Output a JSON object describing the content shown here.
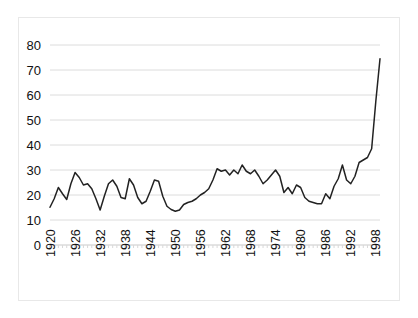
{
  "chart_data": {
    "type": "line",
    "title": "",
    "subtitle": "",
    "xlabel": "",
    "ylabel": "",
    "xlim": [
      1920,
      1999
    ],
    "ylim": [
      0,
      80
    ],
    "ytick_step": 10,
    "yticks": [
      0,
      10,
      20,
      30,
      40,
      50,
      60,
      70,
      80
    ],
    "xticks": [
      1920,
      1926,
      1932,
      1938,
      1944,
      1950,
      1956,
      1962,
      1968,
      1974,
      1980,
      1986,
      1992,
      1998
    ],
    "xtick_labels": [
      "1920",
      "1926",
      "1932",
      "1938",
      "1944",
      "1950",
      "1956",
      "1962",
      "1968",
      "1974",
      "1980",
      "1986",
      "1992",
      "1998"
    ],
    "ytick_labels": [
      "0",
      "10",
      "20",
      "30",
      "40",
      "50",
      "60",
      "70",
      "80"
    ],
    "grid": "horizontal",
    "legend": "none",
    "legend_position": "none",
    "line_color": "#222222",
    "grid_color": "#dcdcdc",
    "background_color": "#ffffff",
    "series": [
      {
        "name": "value",
        "x": [
          1920,
          1921,
          1922,
          1923,
          1924,
          1925,
          1926,
          1927,
          1928,
          1929,
          1930,
          1931,
          1932,
          1933,
          1934,
          1935,
          1936,
          1937,
          1938,
          1939,
          1940,
          1941,
          1942,
          1943,
          1944,
          1945,
          1946,
          1947,
          1948,
          1949,
          1950,
          1951,
          1952,
          1953,
          1954,
          1955,
          1956,
          1957,
          1958,
          1959,
          1960,
          1961,
          1962,
          1963,
          1964,
          1965,
          1966,
          1967,
          1968,
          1969,
          1970,
          1971,
          1972,
          1973,
          1974,
          1975,
          1976,
          1977,
          1978,
          1979,
          1980,
          1981,
          1982,
          1983,
          1984,
          1985,
          1986,
          1987,
          1988,
          1989,
          1990,
          1991,
          1992,
          1993,
          1994,
          1995,
          1996,
          1997,
          1998,
          1999
        ],
        "values": [
          15.1,
          18.5,
          23.0,
          20.5,
          18.2,
          24.5,
          29.0,
          27.0,
          24.0,
          24.5,
          22.5,
          18.5,
          14.0,
          19.5,
          24.5,
          26.0,
          23.5,
          19.0,
          18.5,
          26.5,
          24.0,
          19.0,
          16.5,
          17.5,
          21.5,
          26.0,
          25.5,
          19.5,
          15.5,
          14.2,
          13.5,
          14.0,
          16.2,
          17.0,
          17.5,
          18.5,
          20.0,
          21.0,
          22.5,
          26.0,
          30.5,
          29.5,
          30.0,
          28.0,
          30.0,
          28.5,
          32.0,
          29.5,
          28.5,
          30.0,
          27.5,
          24.5,
          26.0,
          28.0,
          30.0,
          27.5,
          21.0,
          23.0,
          20.5,
          24.0,
          23.0,
          19.0,
          17.5,
          17.0,
          16.5,
          16.5,
          20.5,
          18.5,
          23.5,
          26.5,
          32.0,
          26.0,
          24.5,
          27.5,
          33.0,
          34.0,
          35.0,
          38.5,
          57.5,
          74.5
        ]
      }
    ]
  },
  "figure": {
    "plot_left_px": 50,
    "plot_right_px": 380,
    "plot_top_px": 45,
    "plot_bottom_px": 245
  }
}
